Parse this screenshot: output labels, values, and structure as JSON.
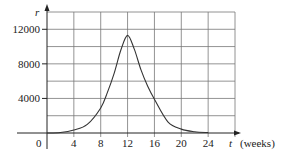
{
  "chart_data": {
    "type": "line",
    "title": "",
    "xlabel": "t (weeks)",
    "xlabel_var": "t",
    "xlabel_unit": "(weeks)",
    "ylabel": "r",
    "xlim": [
      0,
      28
    ],
    "ylim": [
      0,
      14000
    ],
    "grid": true,
    "legend": null,
    "x_ticks": [
      4,
      8,
      12,
      16,
      20,
      24
    ],
    "y_ticks": [
      4000,
      8000,
      12000
    ],
    "origin_label": "0",
    "series": [
      {
        "name": "r(t)",
        "x": [
          0,
          2,
          4,
          6,
          8,
          9,
          10,
          11,
          12,
          13,
          14,
          15,
          16,
          18,
          20,
          22,
          24
        ],
        "values": [
          0,
          60,
          350,
          1000,
          2900,
          4700,
          6900,
          9600,
          11300,
          9700,
          7300,
          5400,
          3900,
          1300,
          450,
          150,
          50
        ]
      }
    ]
  }
}
